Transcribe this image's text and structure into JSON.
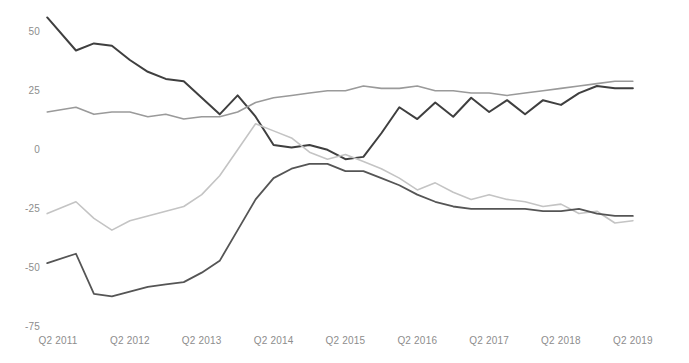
{
  "chart_data": {
    "type": "line",
    "title": "",
    "xlabel": "",
    "ylabel": "",
    "ylim": [
      -75,
      60
    ],
    "xlim": [
      2011.25,
      2019.6
    ],
    "grid": false,
    "legend": "none",
    "y_ticks": [
      "50",
      "25",
      "0",
      "-25",
      "-50",
      "-75"
    ],
    "y_tick_values": [
      50,
      25,
      0,
      -25,
      -50,
      -75
    ],
    "x_ticks": [
      "Q2 2011",
      "Q2 2012",
      "Q2 2013",
      "Q2 2014",
      "Q2 2015",
      "Q2 2016",
      "Q2 2017",
      "Q2 2018",
      "Q2 2019"
    ],
    "x_tick_values": [
      2011.25,
      2012.25,
      2013.25,
      2014.25,
      2015.25,
      2016.25,
      2017.25,
      2018.25,
      2019.25
    ],
    "series": [
      {
        "name": "series-1-dark-declining",
        "color": "#3f3f3f",
        "width": 2.0,
        "x": [
          2011.1,
          2011.5,
          2011.75,
          2012.0,
          2012.25,
          2012.5,
          2012.75,
          2013.0,
          2013.25,
          2013.5,
          2013.75,
          2014.0,
          2014.25,
          2014.5,
          2014.75,
          2015.0,
          2015.25,
          2015.5,
          2015.75,
          2016.0,
          2016.25,
          2016.5,
          2016.75,
          2017.0,
          2017.25,
          2017.5,
          2017.75,
          2018.0,
          2018.25,
          2018.5,
          2018.75,
          2019.0,
          2019.25
        ],
        "y": [
          56,
          42,
          45,
          44,
          38,
          33,
          30,
          29,
          22,
          15,
          23,
          14,
          2,
          1,
          2,
          0,
          -4,
          -3,
          7,
          18,
          13,
          20,
          14,
          22,
          16,
          21,
          15,
          21,
          19,
          24,
          27,
          26,
          26
        ]
      },
      {
        "name": "series-2-gray-rising",
        "color": "#9a9a9a",
        "width": 1.6,
        "x": [
          2011.1,
          2011.5,
          2011.75,
          2012.0,
          2012.25,
          2012.5,
          2012.75,
          2013.0,
          2013.25,
          2013.5,
          2013.75,
          2014.0,
          2014.25,
          2014.5,
          2014.75,
          2015.0,
          2015.25,
          2015.5,
          2015.75,
          2016.0,
          2016.25,
          2016.5,
          2016.75,
          2017.0,
          2017.25,
          2017.5,
          2017.75,
          2018.0,
          2018.25,
          2018.5,
          2018.75,
          2019.0,
          2019.25
        ],
        "y": [
          16,
          18,
          15,
          16,
          16,
          14,
          15,
          13,
          14,
          14,
          16,
          20,
          22,
          23,
          24,
          25,
          25,
          27,
          26,
          26,
          27,
          25,
          25,
          24,
          24,
          23,
          24,
          25,
          26,
          27,
          28,
          29,
          29
        ]
      },
      {
        "name": "series-3-light-declining",
        "color": "#c4c4c4",
        "width": 1.6,
        "x": [
          2011.1,
          2011.5,
          2011.75,
          2012.0,
          2012.25,
          2012.5,
          2012.75,
          2013.0,
          2013.25,
          2013.5,
          2013.75,
          2014.0,
          2014.25,
          2014.5,
          2014.75,
          2015.0,
          2015.25,
          2015.5,
          2015.75,
          2016.0,
          2016.25,
          2016.5,
          2016.75,
          2017.0,
          2017.25,
          2017.5,
          2017.75,
          2018.0,
          2018.25,
          2018.5,
          2018.75,
          2019.0,
          2019.25
        ],
        "y": [
          -27,
          -22,
          -29,
          -34,
          -30,
          -28,
          -26,
          -24,
          -19,
          -11,
          0,
          11,
          8,
          5,
          -1,
          -4,
          -2,
          -5,
          -8,
          -12,
          -17,
          -14,
          -18,
          -21,
          -19,
          -21,
          -22,
          -24,
          -23,
          -27,
          -26,
          -31,
          -30
        ]
      },
      {
        "name": "series-4-dark-rising",
        "color": "#555555",
        "width": 1.8,
        "x": [
          2011.1,
          2011.5,
          2011.75,
          2012.0,
          2012.25,
          2012.5,
          2012.75,
          2013.0,
          2013.25,
          2013.5,
          2013.75,
          2014.0,
          2014.25,
          2014.5,
          2014.75,
          2015.0,
          2015.25,
          2015.5,
          2015.75,
          2016.0,
          2016.25,
          2016.5,
          2016.75,
          2017.0,
          2017.25,
          2017.5,
          2017.75,
          2018.0,
          2018.25,
          2018.5,
          2018.75,
          2019.0,
          2019.25
        ],
        "y": [
          -48,
          -44,
          -61,
          -62,
          -60,
          -58,
          -57,
          -56,
          -52,
          -47,
          -34,
          -21,
          -12,
          -8,
          -6,
          -6,
          -9,
          -9,
          -12,
          -15,
          -19,
          -22,
          -24,
          -25,
          -25,
          -25,
          -25,
          -26,
          -26,
          -25,
          -27,
          -28,
          -28
        ]
      }
    ]
  }
}
